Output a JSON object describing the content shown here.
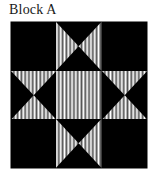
{
  "page": {
    "title": "Block A",
    "background_color": "#ffffff"
  },
  "block": {
    "name": "Block A",
    "pattern_name": "Ohio Star",
    "grid_rows": 3,
    "grid_cols": 3,
    "fabric_colors": {
      "dark": "#000000",
      "striped_light": "#ffffff",
      "stripe_background": "#000000"
    },
    "stripe": {
      "direction": "vertical",
      "period_px": 3,
      "light_width_px": 2,
      "dark_width_px": 1
    },
    "units": [
      {
        "position": "top-left",
        "type": "solid",
        "fill": "dark"
      },
      {
        "position": "top-center",
        "type": "hourglass",
        "striped_triangles": "left-right"
      },
      {
        "position": "top-right",
        "type": "solid",
        "fill": "dark"
      },
      {
        "position": "middle-left",
        "type": "hourglass",
        "striped_triangles": "top-bottom"
      },
      {
        "position": "center",
        "type": "solid",
        "fill": "striped"
      },
      {
        "position": "middle-right",
        "type": "hourglass",
        "striped_triangles": "top-bottom"
      },
      {
        "position": "bottom-left",
        "type": "solid",
        "fill": "dark"
      },
      {
        "position": "bottom-center",
        "type": "hourglass",
        "striped_triangles": "left-right"
      },
      {
        "position": "bottom-right",
        "type": "solid",
        "fill": "dark"
      }
    ]
  }
}
